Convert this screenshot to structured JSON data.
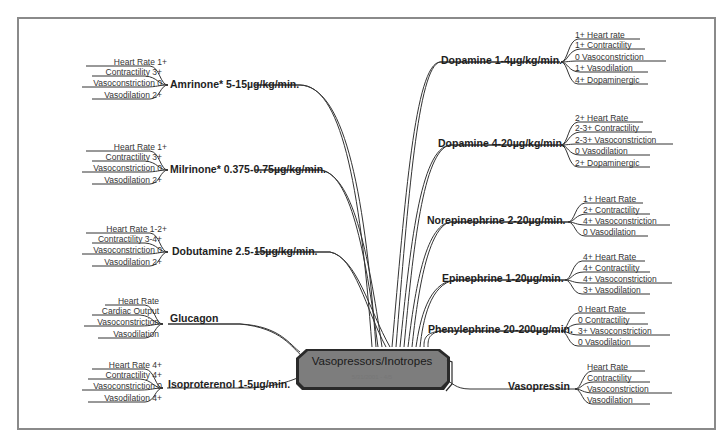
{
  "diagram": {
    "type": "mind-map",
    "central_node": {
      "title": "Vasopressors/Inotropes",
      "date": "5/31/2001 - 4/5"
    },
    "left_branches": [
      {
        "name": "Amrinone* 5-15µg/kg/min.",
        "properties": [
          "Heart Rate 1+",
          "Contractility 3+",
          "Vasoconstriction 0",
          "Vasodilation 2+"
        ]
      },
      {
        "name": "Milrinone* 0.375-0.75µg/kg/min.",
        "properties": [
          "Heart Rate 1+",
          "Contractility 3+",
          "Vasoconstriction 0",
          "Vasodilation 2+"
        ]
      },
      {
        "name": "Dobutamine 2.5-15µg/kg/min.",
        "properties": [
          "Heart Rate 1-2+",
          "Contractility 3-4+",
          "Vasoconstriction  0",
          "Vasodilation 2+"
        ]
      },
      {
        "name": "Glucagon",
        "properties": [
          "Heart Rate",
          "Cardiac Output",
          "Vasoconstriction",
          "Vasodilation"
        ]
      },
      {
        "name": "Isoproterenol 1-5µg/min.",
        "properties": [
          "Heart Rate 4+",
          "Contractility 4+",
          "Vasoconstriction 0",
          "Vasodilation 4+"
        ]
      }
    ],
    "right_branches": [
      {
        "name": "Dopamine 1-4µg/kg/min.",
        "properties": [
          "1+ Heart rate",
          "1+ Contractility",
          "0  Vasoconstriction",
          "1+ Vasodilation",
          "4+ Dopaminergic"
        ]
      },
      {
        "name": "Dopamine 4-20µg/kg/min.",
        "properties": [
          "2+ Heart Rate",
          "2-3+ Contractility",
          "2-3+ Vasoconstriction",
          "0  Vasodilation",
          "2+ Dopaminergic"
        ]
      },
      {
        "name": "Norepinephrine 2-20µg/min.",
        "properties": [
          "1+ Heart Rate",
          "2+ Contractility",
          "4+ Vasoconstriction",
          "0  Vasodilation"
        ]
      },
      {
        "name": "Epinephrine 1-20µg/min.",
        "properties": [
          "4+ Heart Rate",
          "4+ Contractility",
          "4+ Vasoconstriction",
          "3+ Vasodilation"
        ]
      },
      {
        "name": "Phenylephrine 20-200µg/min.",
        "properties": [
          "0  Heart Rate",
          "0  Contractility",
          "3+ Vasoconstriction",
          "0  Vasodilation"
        ]
      },
      {
        "name": "Vasopressin",
        "properties": [
          "Heart Rate",
          "Contractility",
          "Vasoconstriction",
          "Vasodilation"
        ]
      }
    ],
    "footnote_marker": "*",
    "colors": {
      "node_fill": "#7d7d7d",
      "node_border": "#2a2a2a",
      "line": "#333333",
      "frame": "#8a8a8a"
    }
  }
}
